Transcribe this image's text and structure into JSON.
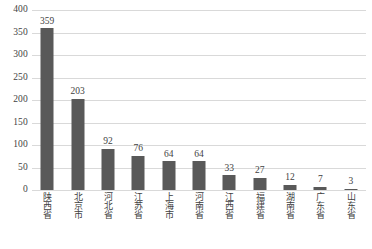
{
  "chart_data": {
    "type": "bar",
    "title": "",
    "subtitle": "",
    "xlabel": "",
    "ylabel": "",
    "ylim": [
      0,
      400
    ],
    "ytick_step": 50,
    "yticks": [
      "400",
      "350",
      "300",
      "250",
      "200",
      "150",
      "100",
      "50",
      "0"
    ],
    "grid": true,
    "legend": "none",
    "bar_color": "#595959",
    "gridline_color": "#d9d9d9",
    "text_color": "#3f3f3f",
    "xtick_rotation": 90,
    "categories": [
      "陕西省",
      "北京市",
      "河北省",
      "江苏省",
      "上海市",
      "河南省",
      "江西省",
      "福建省",
      "湖南省",
      "广东省",
      "山东省"
    ],
    "values": [
      359,
      203,
      92,
      76,
      64,
      64,
      33,
      27,
      12,
      7,
      3
    ],
    "data_labels": [
      "359",
      "203",
      "92",
      "76",
      "64",
      "64",
      "33",
      "27",
      "12",
      "7",
      "3"
    ],
    "caption": ""
  }
}
